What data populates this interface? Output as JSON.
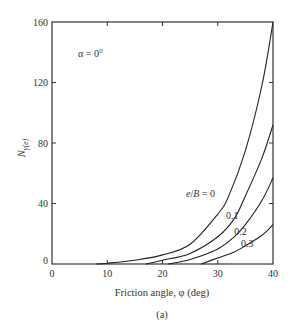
{
  "chart_data": {
    "type": "line",
    "title": "",
    "subtitle": "(a)",
    "xlabel": "Friction angle, φ (deg)",
    "ylabel": "Nγ(e)",
    "xlim": [
      0,
      40
    ],
    "ylim": [
      0,
      160
    ],
    "xticks": [
      0,
      10,
      20,
      30,
      40
    ],
    "yticks": [
      0,
      40,
      80,
      120,
      160
    ],
    "grid": false,
    "annotation": "α = 0°",
    "legend_position": "inline labels on curves",
    "series": [
      {
        "name": "e/B = 0",
        "label": "e/B = 0",
        "x": [
          8,
          10,
          15,
          20,
          25,
          30,
          32,
          35,
          38,
          40
        ],
        "values": [
          0,
          0.5,
          2.5,
          6,
          13,
          33,
          45,
          75,
          118,
          160
        ]
      },
      {
        "name": "e/B = 0.1",
        "label": "0.1",
        "x": [
          17,
          20,
          25,
          30,
          33,
          35,
          38,
          40
        ],
        "values": [
          0,
          2.5,
          7,
          18,
          30,
          45,
          70,
          92
        ]
      },
      {
        "name": "e/B = 0.2",
        "label": "0.2",
        "x": [
          21,
          25,
          30,
          33,
          35,
          38,
          40
        ],
        "values": [
          0,
          3,
          10,
          18,
          26,
          42,
          57
        ]
      },
      {
        "name": "e/B = 0.3",
        "label": "0.3",
        "x": [
          27,
          30,
          33,
          35,
          38,
          40
        ],
        "values": [
          0,
          4,
          8,
          12,
          19,
          26
        ]
      }
    ],
    "label_positions": {
      "e/B = 0": [
        29.5,
        44
      ],
      "0.1": [
        31.5,
        30
      ],
      "0.2": [
        33.0,
        19
      ],
      "0.3": [
        34.2,
        11
      ]
    }
  },
  "plot_box": {
    "left": 52,
    "top": 22,
    "right": 273,
    "bottom": 264
  }
}
